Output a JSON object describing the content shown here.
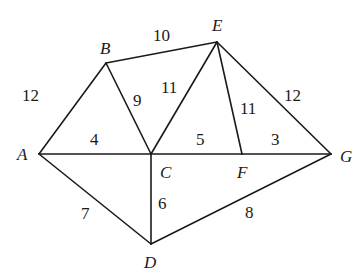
{
  "graph": {
    "vertices": [
      {
        "id": "A",
        "label": "A",
        "x": 39,
        "y": 154,
        "lx": 17,
        "ly": 160
      },
      {
        "id": "B",
        "label": "B",
        "x": 106,
        "y": 63,
        "lx": 100,
        "ly": 54
      },
      {
        "id": "C",
        "label": "C",
        "x": 151,
        "y": 154,
        "lx": 160,
        "ly": 178
      },
      {
        "id": "D",
        "label": "D",
        "x": 151,
        "y": 244,
        "lx": 144,
        "ly": 268
      },
      {
        "id": "E",
        "label": "E",
        "x": 217,
        "y": 42,
        "lx": 212,
        "ly": 31
      },
      {
        "id": "F",
        "label": "F",
        "x": 242,
        "y": 154,
        "lx": 237,
        "ly": 178
      },
      {
        "id": "G",
        "label": "G",
        "x": 331,
        "y": 154,
        "lx": 340,
        "ly": 162
      }
    ],
    "edges": [
      {
        "from": "A",
        "to": "B",
        "weight": "12",
        "lx": 22,
        "ly": 101
      },
      {
        "from": "B",
        "to": "E",
        "weight": "10",
        "lx": 153,
        "ly": 41
      },
      {
        "from": "B",
        "to": "C",
        "weight": "9",
        "lx": 133,
        "ly": 106
      },
      {
        "from": "C",
        "to": "E",
        "weight": "11",
        "lx": 161,
        "ly": 93
      },
      {
        "from": "E",
        "to": "F",
        "weight": "11",
        "lx": 240,
        "ly": 114
      },
      {
        "from": "E",
        "to": "G",
        "weight": "12",
        "lx": 284,
        "ly": 101
      },
      {
        "from": "A",
        "to": "C",
        "weight": "4",
        "lx": 90,
        "ly": 145
      },
      {
        "from": "C",
        "to": "F",
        "weight": "5",
        "lx": 196,
        "ly": 145
      },
      {
        "from": "F",
        "to": "G",
        "weight": "3",
        "lx": 271,
        "ly": 145
      },
      {
        "from": "A",
        "to": "D",
        "weight": "7",
        "lx": 81,
        "ly": 219
      },
      {
        "from": "C",
        "to": "D",
        "weight": "6",
        "lx": 158,
        "ly": 209
      },
      {
        "from": "D",
        "to": "G",
        "weight": "8",
        "lx": 245,
        "ly": 218
      }
    ]
  }
}
